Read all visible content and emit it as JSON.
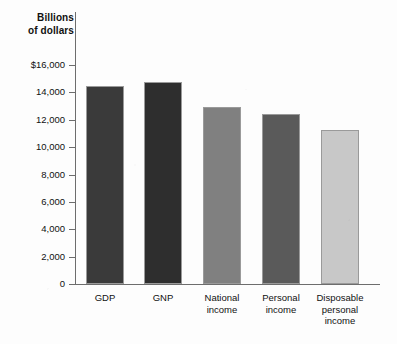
{
  "chart_data": {
    "type": "bar",
    "title": "",
    "xlabel": "",
    "ylabel": "Billions of dollars",
    "ylim": [
      0,
      16000
    ],
    "grid": false,
    "legend": false,
    "categories": [
      "GDP",
      "GNP",
      "National income",
      "Personal income",
      "Disposable personal income"
    ],
    "values": [
      14500,
      14750,
      12950,
      12400,
      11250
    ],
    "bar_colors": [
      "#3a3a3a",
      "#2e2e2e",
      "#808080",
      "#5a5a5a",
      "#c8c8c8"
    ],
    "ytick_labels": [
      "0",
      "2,000",
      "4,000",
      "6,000",
      "8,000",
      "10,000",
      "12,000",
      "14,000",
      "$16,000"
    ],
    "ytick_values": [
      0,
      2000,
      4000,
      6000,
      8000,
      10000,
      12000,
      14000,
      16000
    ]
  },
  "axis": {
    "y_title_line1": "Billions",
    "y_title_line2": "of dollars"
  },
  "category_labels": [
    [
      "GDP"
    ],
    [
      "GNP"
    ],
    [
      "National",
      "income"
    ],
    [
      "Personal",
      "income"
    ],
    [
      "Disposable",
      "personal",
      "income"
    ]
  ]
}
